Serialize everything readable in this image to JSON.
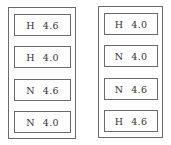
{
  "columns": [
    {
      "cells": [
        {
          "group": "H",
          "value": "4.6"
        },
        {
          "group": "H",
          "value": "4.0"
        },
        {
          "group": "N",
          "value": "4.6"
        },
        {
          "group": "N",
          "value": "4.0"
        }
      ]
    },
    {
      "cells": [
        {
          "group": "H",
          "value": "4.0"
        },
        {
          "group": "N",
          "value": "4.0"
        },
        {
          "group": "N",
          "value": "4.6"
        },
        {
          "group": "H",
          "value": "4.6"
        }
      ]
    }
  ]
}
